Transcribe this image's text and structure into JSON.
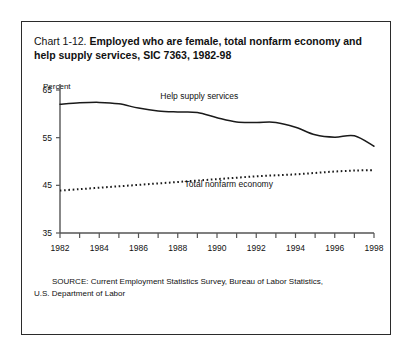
{
  "figure": {
    "number_label": "Chart 1-12.",
    "title_bold": "Employed who are female, total nonfarm economy and help supply services, SIC 7363, 1982-98",
    "axis_unit_label": "Percent",
    "source_line_1": "SOURCE: Current Employment Statistics Survey, Bureau of Labor Statistics,",
    "source_line_2": "U.S. Department of Labor"
  },
  "chart_data": {
    "type": "line",
    "title": "Chart 1-12. Employed who are female, total nonfarm economy and help supply services, SIC 7363, 1982-98",
    "xlabel": "",
    "ylabel": "Percent",
    "xlim": [
      1982,
      1998
    ],
    "ylim": [
      35,
      65
    ],
    "yticks": [
      35,
      45,
      55,
      65
    ],
    "xticks": [
      1982,
      1984,
      1986,
      1988,
      1990,
      1992,
      1994,
      1996,
      1998
    ],
    "xtick_labels": [
      "1982",
      "1984",
      "1986",
      "1988",
      "1990",
      "1992",
      "1994",
      "1996",
      "1998"
    ],
    "ytick_labels": [
      "35",
      "45",
      "55",
      "65"
    ],
    "minor_xticks_every": 1,
    "grid": false,
    "legend_position": "inline-annotation",
    "x": [
      1982,
      1983,
      1984,
      1985,
      1986,
      1987,
      1988,
      1989,
      1990,
      1991,
      1992,
      1993,
      1994,
      1995,
      1996,
      1997,
      1998
    ],
    "series": [
      {
        "name": "Help supply services",
        "style": "solid",
        "color": "#1a1a1a",
        "label_x": 1989.1,
        "label_y": 63.2,
        "values": [
          62.0,
          62.3,
          62.4,
          62.1,
          61.2,
          60.6,
          60.4,
          60.3,
          59.2,
          58.3,
          58.2,
          58.2,
          57.2,
          55.6,
          55.1,
          55.4,
          53.2
        ]
      },
      {
        "name": "Total nonfarm economy",
        "style": "dotted",
        "color": "#1a1a1a",
        "label_x": 1990.6,
        "label_y": 44.6,
        "values": [
          43.9,
          44.2,
          44.5,
          44.8,
          45.1,
          45.4,
          45.7,
          46.0,
          46.3,
          46.6,
          46.9,
          47.1,
          47.3,
          47.6,
          47.9,
          48.1,
          48.2
        ]
      }
    ]
  }
}
